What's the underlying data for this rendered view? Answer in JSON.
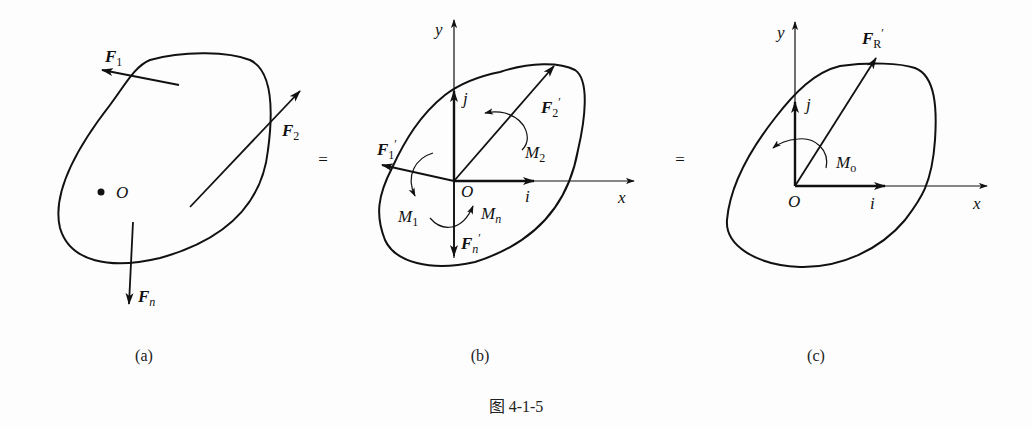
{
  "figure": {
    "caption": "图 4-1-5",
    "panels": [
      {
        "id": "a",
        "label": "(a)",
        "point": "O",
        "forces": [
          {
            "symbol": "F",
            "subscript": "1",
            "prime": false
          },
          {
            "symbol": "F",
            "subscript": "2",
            "prime": false
          },
          {
            "symbol": "F",
            "subscript": "n",
            "prime": false
          }
        ]
      },
      {
        "id": "b",
        "label": "(b)",
        "origin": "O",
        "axes": {
          "x": "x",
          "y": "y"
        },
        "unit_vectors": {
          "i": "i",
          "j": "j"
        },
        "forces": [
          {
            "symbol": "F",
            "subscript": "1",
            "prime": true
          },
          {
            "symbol": "F",
            "subscript": "2",
            "prime": true
          },
          {
            "symbol": "F",
            "subscript": "n",
            "prime": true
          }
        ],
        "moments": [
          {
            "symbol": "M",
            "subscript": "1"
          },
          {
            "symbol": "M",
            "subscript": "2"
          },
          {
            "symbol": "M",
            "subscript": "n"
          }
        ]
      },
      {
        "id": "c",
        "label": "(c)",
        "origin": "O",
        "axes": {
          "x": "x",
          "y": "y"
        },
        "unit_vectors": {
          "i": "i",
          "j": "j"
        },
        "forces": [
          {
            "symbol": "F",
            "subscript": "R",
            "prime": true
          }
        ],
        "moments": [
          {
            "symbol": "M",
            "subscript": "o"
          }
        ]
      }
    ],
    "equals_signs": [
      "=",
      "="
    ]
  },
  "colors": {
    "ink": "#111111",
    "background": "#fdfdfd"
  }
}
